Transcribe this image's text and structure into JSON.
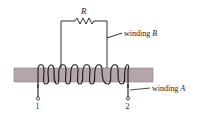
{
  "diagram": {
    "type": "transformer-windings-on-core",
    "core": {
      "fill": "#b3a6aa",
      "stroke": "#8a7f83"
    },
    "resistor": {
      "label": "R"
    },
    "labels": {
      "winding_b": "winding ",
      "winding_b_var": "B",
      "winding_a": "winding ",
      "winding_a_var": "A",
      "terminal_1": "1",
      "terminal_2": "2"
    },
    "colors": {
      "line": "#1a1a1a",
      "background": "#ffffff"
    }
  }
}
